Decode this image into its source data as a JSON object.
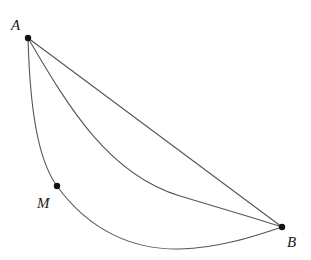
{
  "diagram": {
    "title": "",
    "points": {
      "A": {
        "label": "A",
        "x": 28,
        "y": 38
      },
      "B": {
        "label": "B",
        "x": 282,
        "y": 227
      },
      "M": {
        "label": "M",
        "x": 57,
        "y": 186
      }
    },
    "paths": [
      {
        "name": "straight-segment-AB",
        "d": "M28 38 L282 227"
      },
      {
        "name": "middle-curve-AB",
        "d": "M28 38 C70 110 110 175 180 196 C220 208 255 218 282 227"
      },
      {
        "name": "lower-curve-AMB",
        "d": "M28 38 C30 110 38 160 57 186 C90 232 135 250 180 249 C220 248 255 236 282 227"
      }
    ],
    "colors": {
      "line": "#555555",
      "point": "#111111",
      "background": "#ffffff"
    }
  }
}
